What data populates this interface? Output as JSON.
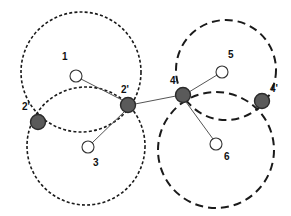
{
  "figure": {
    "width": 291,
    "height": 216,
    "background": "#ffffff"
  },
  "style": {
    "filled_node_fill": "#5a5a5a",
    "filled_node_stroke": "#2b2b2b",
    "hollow_node_fill": "#ffffff",
    "hollow_node_stroke": "#333333",
    "edge_color": "#555555",
    "circle_color": "#1a1a1a",
    "label_color": "#111111",
    "left_dash_pattern": "3,2.2",
    "right_dash_pattern": "8,5"
  },
  "circles": [
    {
      "id": "left-upper",
      "group": "left",
      "cx": 81,
      "cy": 72,
      "r": 60,
      "dash": "3,2.2",
      "width": 1.6
    },
    {
      "id": "left-lower",
      "group": "left",
      "cx": 86,
      "cy": 146,
      "r": 59,
      "dash": "3,2.2",
      "width": 1.6
    },
    {
      "id": "right-upper",
      "group": "right",
      "cx": 226,
      "cy": 70,
      "r": 50,
      "dash": "8,5",
      "width": 2.0
    },
    {
      "id": "right-lower",
      "group": "right",
      "cx": 216,
      "cy": 150,
      "r": 58,
      "dash": "8,5",
      "width": 2.0
    }
  ],
  "nodes": [
    {
      "id": "n1",
      "label": "1",
      "type": "hollow",
      "cx": 76,
      "cy": 76,
      "r": 6.0,
      "label_x": 62,
      "label_y": 52
    },
    {
      "id": "n2prime_l",
      "label": "2'",
      "type": "filled",
      "cx": 38,
      "cy": 122,
      "r": 7.5,
      "label_x": 22,
      "label_y": 102
    },
    {
      "id": "n2prime_r",
      "label": "2'",
      "type": "filled",
      "cx": 128,
      "cy": 105,
      "r": 7.5,
      "label_x": 121,
      "label_y": 85
    },
    {
      "id": "n3",
      "label": "3",
      "type": "hollow",
      "cx": 88,
      "cy": 147,
      "r": 6.0,
      "label_x": 93,
      "label_y": 158
    },
    {
      "id": "n4",
      "label": "4",
      "type": "filled",
      "cx": 183,
      "cy": 95,
      "r": 7.5,
      "label_x": 170,
      "label_y": 76
    },
    {
      "id": "n5",
      "label": "5",
      "type": "hollow",
      "cx": 222,
      "cy": 72,
      "r": 6.0,
      "label_x": 228,
      "label_y": 50
    },
    {
      "id": "n6",
      "label": "6",
      "type": "hollow",
      "cx": 216,
      "cy": 144,
      "r": 6.0,
      "label_x": 224,
      "label_y": 152
    },
    {
      "id": "n4prime",
      "label": "4'",
      "type": "filled",
      "cx": 262,
      "cy": 101,
      "r": 7.5,
      "label_x": 270,
      "label_y": 84
    }
  ],
  "edges": [
    {
      "id": "e1",
      "from": "n1",
      "to": "n2prime_r",
      "x1": 81,
      "y1": 79,
      "x2": 124,
      "y2": 101
    },
    {
      "id": "e2",
      "from": "n3",
      "to": "n2prime_r",
      "x1": 92,
      "y1": 143,
      "x2": 125,
      "y2": 111
    },
    {
      "id": "e3",
      "from": "n2prime_r",
      "to": "n4",
      "x1": 135,
      "y1": 104,
      "x2": 176,
      "y2": 96
    },
    {
      "id": "e4",
      "from": "n4",
      "to": "n5",
      "x1": 189,
      "y1": 92,
      "x2": 217,
      "y2": 75
    },
    {
      "id": "e5",
      "from": "n4",
      "to": "n6",
      "x1": 186,
      "y1": 102,
      "x2": 213,
      "y2": 139
    }
  ]
}
